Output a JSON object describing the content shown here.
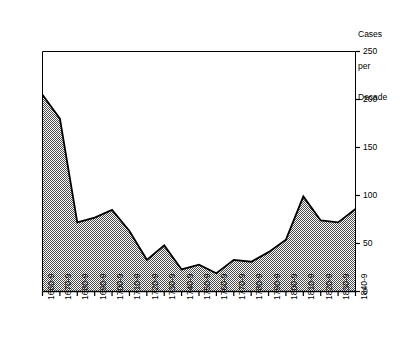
{
  "chart_data": {
    "type": "area",
    "title": "",
    "subtitle": "",
    "xlabel": "",
    "ylabel": "Cases per Decade",
    "ylabel_lines": [
      "Cases",
      "per",
      "Decade"
    ],
    "ylim": [
      0,
      250
    ],
    "yticks": [
      0,
      50,
      100,
      150,
      200,
      250
    ],
    "ytick_labels": [
      "0",
      "50",
      "100",
      "150",
      "200",
      "250"
    ],
    "grid": false,
    "legend": null,
    "y_axis_position": "right",
    "fill_pattern": "50-percent-checkerboard-dither",
    "fill_color": "#808080",
    "line_color": "#000000",
    "frame_color": "#000000",
    "background_color": "#ffffff",
    "categories": [
      "1660-9",
      "1670-9",
      "1680-9",
      "1690-9",
      "1700-9",
      "1710-9",
      "1720-9",
      "1730-9",
      "1740-9",
      "1750-9",
      "1760-9",
      "1770-9",
      "1780-9",
      "1790-9",
      "1800-9",
      "1810-9",
      "1820-9",
      "1830-9",
      "1840-9"
    ],
    "values": [
      205,
      180,
      72,
      77,
      85,
      63,
      33,
      48,
      23,
      28,
      19,
      33,
      31,
      41,
      54,
      99,
      74,
      72,
      86
    ],
    "annotations": []
  },
  "axis_title": {
    "line1": "Cases",
    "line2": "per",
    "line3": "Decade"
  }
}
